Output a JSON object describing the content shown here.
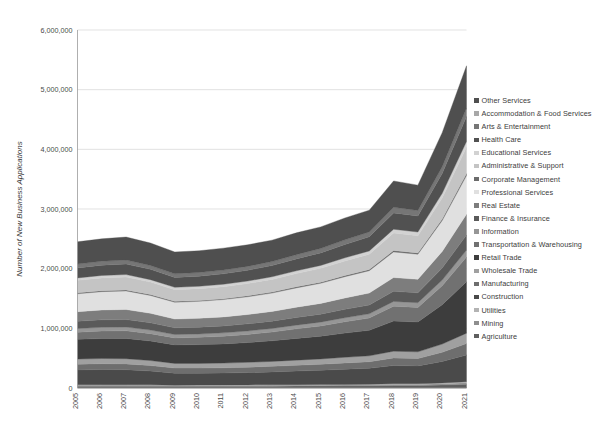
{
  "chart_data": {
    "type": "area",
    "stacked": true,
    "title": "",
    "xlabel": "",
    "ylabel": "Number of New Business Applications",
    "x": [
      2005,
      2006,
      2007,
      2008,
      2009,
      2010,
      2011,
      2012,
      2013,
      2014,
      2015,
      2016,
      2017,
      2018,
      2019,
      2020,
      2021
    ],
    "categories": [
      "2005",
      "2006",
      "2007",
      "2008",
      "2009",
      "2010",
      "2011",
      "2012",
      "2013",
      "2014",
      "2015",
      "2016",
      "2017",
      "2018",
      "2019",
      "2020",
      "2021"
    ],
    "ylim": [
      0,
      6000000
    ],
    "ytick_values": [
      0,
      1000000,
      2000000,
      3000000,
      4000000,
      5000000,
      6000000
    ],
    "ytick_labels": [
      "0",
      "1,000,000",
      "2,000,000",
      "3,000,000",
      "4,000,000",
      "5,000,000",
      "6,000,000"
    ],
    "grid": true,
    "grid_axis": "y",
    "legend_position": "right",
    "legend_order": "reverse-stack",
    "totals": [
      2450000,
      2500000,
      2530000,
      2430000,
      2280000,
      2300000,
      2340000,
      2400000,
      2480000,
      2600000,
      2700000,
      2850000,
      2980000,
      3480000,
      3400000,
      4280000,
      5400000
    ],
    "series": [
      {
        "name": "Agriculture",
        "color": "#5f5f5f",
        "values": [
          30000,
          31000,
          31000,
          30000,
          28000,
          29000,
          29000,
          30000,
          31000,
          32000,
          33000,
          35000,
          36000,
          41000,
          41000,
          50000,
          62000
        ]
      },
      {
        "name": "Mining",
        "color": "#8e8e8e",
        "values": [
          14000,
          15000,
          15000,
          14000,
          12000,
          12000,
          13000,
          13000,
          14000,
          14000,
          14000,
          15000,
          15000,
          17000,
          17000,
          20000,
          25000
        ]
      },
      {
        "name": "Utilities",
        "color": "#b3b3b3",
        "values": [
          9000,
          9000,
          9000,
          9000,
          8000,
          8000,
          8000,
          9000,
          9000,
          9000,
          10000,
          10000,
          11000,
          12000,
          12000,
          15000,
          19000
        ]
      },
      {
        "name": "Construction",
        "color": "#4a4a4a",
        "values": [
          250000,
          255000,
          252000,
          230000,
          200000,
          198000,
          200000,
          207000,
          216000,
          228000,
          240000,
          255000,
          268000,
          306000,
          300000,
          360000,
          448000
        ]
      },
      {
        "name": "Manufacturing",
        "color": "#6e6e6e",
        "values": [
          96000,
          97000,
          97000,
          93000,
          86000,
          87000,
          88000,
          90000,
          93000,
          97000,
          100000,
          105000,
          110000,
          127000,
          124000,
          153000,
          192000
        ]
      },
      {
        "name": "Wholesale Trade",
        "color": "#a0a0a0",
        "values": [
          86000,
          87000,
          87000,
          84000,
          78000,
          78000,
          79000,
          81000,
          83000,
          87000,
          90000,
          95000,
          99000,
          114000,
          112000,
          138000,
          173000
        ]
      },
      {
        "name": "Retail Trade",
        "color": "#3d3d3d",
        "values": [
          330000,
          336000,
          340000,
          327000,
          310000,
          315000,
          322000,
          332000,
          345000,
          364000,
          381000,
          405000,
          428000,
          505000,
          500000,
          660000,
          860000
        ]
      },
      {
        "name": "Transportation & Warehousing",
        "color": "#717171",
        "values": [
          120000,
          124000,
          127000,
          124000,
          118000,
          122000,
          128000,
          136000,
          146000,
          160000,
          172000,
          190000,
          206000,
          249000,
          245000,
          318000,
          415000
        ]
      },
      {
        "name": "Information",
        "color": "#969696",
        "values": [
          62000,
          63000,
          63000,
          60000,
          56000,
          56000,
          57000,
          58000,
          60000,
          62000,
          64000,
          67000,
          70000,
          80000,
          78000,
          94000,
          118000
        ]
      },
      {
        "name": "Finance & Insurance",
        "color": "#5a5a5a",
        "values": [
          122000,
          125000,
          126000,
          121000,
          113000,
          114000,
          116000,
          119000,
          123000,
          129000,
          134000,
          141000,
          148000,
          169000,
          166000,
          202000,
          252000
        ]
      },
      {
        "name": "Real Estate",
        "color": "#7d7d7d",
        "values": [
          160000,
          166000,
          169000,
          160000,
          147000,
          149000,
          152000,
          157000,
          163000,
          172000,
          180000,
          191000,
          201000,
          231000,
          226000,
          278000,
          348000
        ]
      },
      {
        "name": "Professional Services",
        "color": "#e0e0e0",
        "values": [
          300000,
          307000,
          311000,
          299000,
          281000,
          284000,
          290000,
          297000,
          308000,
          324000,
          337000,
          357000,
          374000,
          430000,
          421000,
          518000,
          648000
        ]
      },
      {
        "name": "Corporate Management",
        "color": "#6b6b6b",
        "values": [
          16000,
          16000,
          16000,
          16000,
          15000,
          15000,
          15000,
          16000,
          16000,
          17000,
          18000,
          19000,
          20000,
          23000,
          22000,
          27000,
          34000
        ]
      },
      {
        "name": "Administrative & Support",
        "color": "#c4c4c4",
        "values": [
          210000,
          214000,
          216000,
          208000,
          196000,
          198000,
          201000,
          206000,
          213000,
          223000,
          232000,
          245000,
          256000,
          294000,
          288000,
          352000,
          440000
        ]
      },
      {
        "name": "Educational Services",
        "color": "#d2d2d2",
        "values": [
          40000,
          41000,
          42000,
          41000,
          39000,
          40000,
          41000,
          42000,
          44000,
          46000,
          49000,
          52000,
          55000,
          63000,
          62000,
          77000,
          97000
        ]
      },
      {
        "name": "Health Care",
        "color": "#515151",
        "values": [
          168000,
          173000,
          177000,
          173000,
          166000,
          170000,
          175000,
          181000,
          189000,
          200000,
          210000,
          224000,
          237000,
          274000,
          270000,
          335000,
          420000
        ]
      },
      {
        "name": "Arts & Entertainment",
        "color": "#767676",
        "values": [
          64000,
          65000,
          66000,
          64000,
          60000,
          61000,
          62000,
          64000,
          66000,
          70000,
          73000,
          77000,
          81000,
          93000,
          91000,
          112000,
          140000
        ]
      },
      {
        "name": "Other Services",
        "color": "#4f4f4f",
        "values": [
          373000,
          376000,
          386000,
          377000,
          367000,
          364000,
          368000,
          362000,
          359000,
          366000,
          363000,
          367000,
          365000,
          442000,
          425000,
          571000,
          709000
        ]
      }
    ]
  },
  "axes": {
    "y_title": "Number of New Business Applications",
    "y_ticks": [
      "6,000,000",
      "5,000,000",
      "4,000,000",
      "3,000,000",
      "2,000,000",
      "1,000,000",
      "0"
    ],
    "x_ticks": [
      "2005",
      "2006",
      "2007",
      "2008",
      "2009",
      "2010",
      "2011",
      "2012",
      "2013",
      "2014",
      "2015",
      "2016",
      "2017",
      "2018",
      "2019",
      "2020",
      "2021"
    ]
  },
  "legend": {
    "items": [
      {
        "label": "Other Services",
        "color": "#4f4f4f"
      },
      {
        "label": "Accommodation & Food Services",
        "color": "#a8a8a8"
      },
      {
        "label": "Arts & Entertainment",
        "color": "#767676"
      },
      {
        "label": "Health Care",
        "color": "#515151"
      },
      {
        "label": "Educational Services",
        "color": "#d2d2d2"
      },
      {
        "label": "Administrative & Support",
        "color": "#c4c4c4"
      },
      {
        "label": "Corporate Management",
        "color": "#6b6b6b"
      },
      {
        "label": "Professional Services",
        "color": "#e0e0e0"
      },
      {
        "label": "Real Estate",
        "color": "#7d7d7d"
      },
      {
        "label": "Finance & Insurance",
        "color": "#5a5a5a"
      },
      {
        "label": "Information",
        "color": "#969696"
      },
      {
        "label": "Transportation & Warehousing",
        "color": "#717171"
      },
      {
        "label": "Retail Trade",
        "color": "#3d3d3d"
      },
      {
        "label": "Wholesale Trade",
        "color": "#a0a0a0"
      },
      {
        "label": "Manufacturing",
        "color": "#6e6e6e"
      },
      {
        "label": "Construction",
        "color": "#4a4a4a"
      },
      {
        "label": "Utilities",
        "color": "#b3b3b3"
      },
      {
        "label": "Mining",
        "color": "#8e8e8e"
      },
      {
        "label": "Agriculture",
        "color": "#5f5f5f"
      }
    ]
  }
}
